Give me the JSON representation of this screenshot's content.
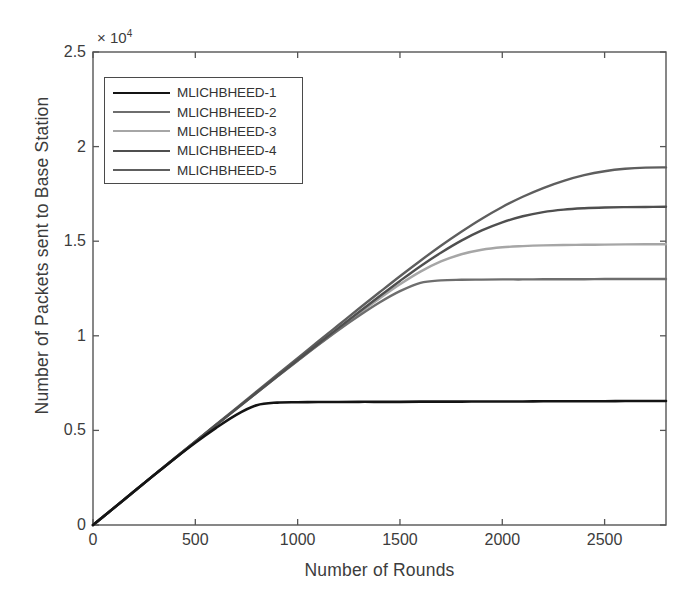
{
  "chart_data": {
    "type": "line",
    "title": "",
    "xlabel": "Number of Rounds",
    "ylabel": "Number of Packets sent to Base Station",
    "y_exponent_label": "× 10",
    "y_exponent_power": "4",
    "y_scale_factor": 10000,
    "xlim": [
      0,
      2800
    ],
    "ylim": [
      0,
      25000
    ],
    "xticks": [
      0,
      500,
      1000,
      1500,
      2000,
      2500
    ],
    "xtick_labels": [
      "0",
      "500",
      "1000",
      "1500",
      "2000",
      "2500"
    ],
    "yticks": [
      0,
      5000,
      10000,
      15000,
      20000,
      25000
    ],
    "ytick_labels": [
      "0",
      "0.5",
      "1",
      "1.5",
      "2",
      "2.5"
    ],
    "grid": false,
    "legend_position": "upper-left",
    "x": [
      0,
      100,
      200,
      300,
      400,
      500,
      600,
      700,
      800,
      900,
      1000,
      1100,
      1200,
      1300,
      1400,
      1500,
      1600,
      1700,
      1800,
      1900,
      2000,
      2100,
      2200,
      2300,
      2400,
      2500,
      2600,
      2700,
      2800
    ],
    "series": [
      {
        "name": "MLICHBHEED-1",
        "color": "#141414",
        "width": 2.6,
        "values": [
          0,
          880,
          1770,
          2650,
          3520,
          4350,
          5120,
          5820,
          6330,
          6470,
          6490,
          6500,
          6500,
          6510,
          6510,
          6510,
          6520,
          6520,
          6520,
          6530,
          6530,
          6530,
          6540,
          6540,
          6540,
          6540,
          6550,
          6550,
          6550
        ]
      },
      {
        "name": "MLICHBHEED-2",
        "color": "#6e6e6e",
        "width": 2.4,
        "values": [
          0,
          880,
          1770,
          2650,
          3530,
          4400,
          5270,
          6130,
          6990,
          7840,
          8680,
          9510,
          10310,
          11060,
          11760,
          12360,
          12800,
          12930,
          12960,
          12970,
          12980,
          12980,
          12990,
          12990,
          12990,
          13000,
          13000,
          13000,
          13000
        ]
      },
      {
        "name": "MLICHBHEED-3",
        "color": "#a6a6a6",
        "width": 2.4,
        "values": [
          0,
          880,
          1770,
          2650,
          3530,
          4400,
          5270,
          6130,
          6990,
          7840,
          8690,
          9530,
          10360,
          11180,
          11970,
          12720,
          13390,
          13930,
          14310,
          14550,
          14680,
          14740,
          14780,
          14800,
          14810,
          14820,
          14830,
          14840,
          14840
        ]
      },
      {
        "name": "MLICHBHEED-4",
        "color": "#4f4f4f",
        "width": 2.4,
        "values": [
          0,
          880,
          1770,
          2650,
          3530,
          4400,
          5270,
          6140,
          7000,
          7860,
          8720,
          9570,
          10420,
          11260,
          12090,
          12900,
          13680,
          14390,
          15030,
          15570,
          16000,
          16320,
          16540,
          16670,
          16740,
          16780,
          16800,
          16810,
          16820
        ]
      },
      {
        "name": "MLICHBHEED-5",
        "color": "#5e5e5e",
        "width": 2.4,
        "values": [
          0,
          880,
          1770,
          2660,
          3540,
          4420,
          5300,
          6180,
          7060,
          7940,
          8820,
          9700,
          10570,
          11440,
          12300,
          13150,
          13970,
          14760,
          15500,
          16190,
          16810,
          17350,
          17810,
          18190,
          18490,
          18700,
          18830,
          18890,
          18900
        ]
      }
    ]
  },
  "axes": {
    "exp_prefix": "× 10",
    "exp_power": "4"
  }
}
